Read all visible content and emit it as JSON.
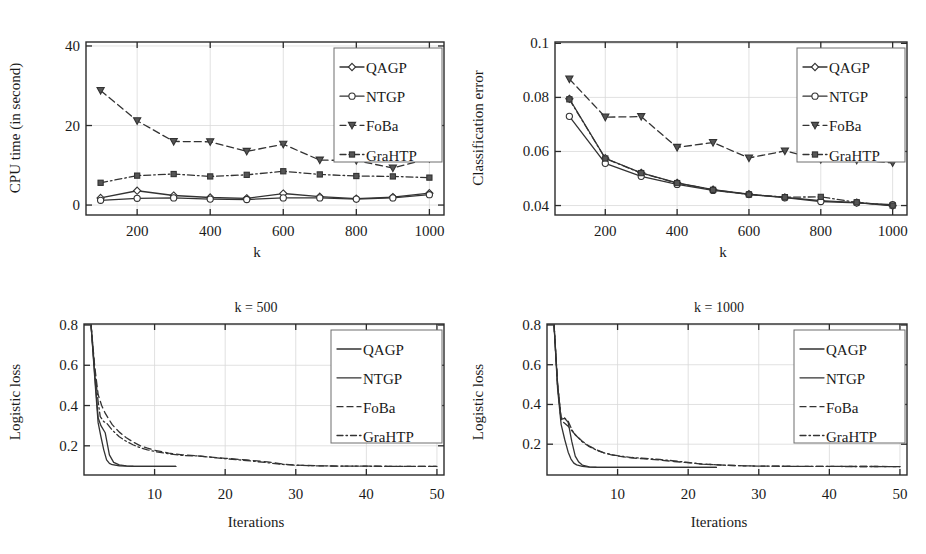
{
  "figure": {
    "panel_count": 4,
    "series_names": [
      "QAGP",
      "NTGP",
      "FoBa",
      "GraHTP"
    ]
  },
  "chart_data": [
    {
      "id": "cpu-time",
      "position": "top-left",
      "type": "line",
      "title": "",
      "xlabel": "k",
      "ylabel": "CPU time (in second)",
      "x": [
        100,
        200,
        300,
        400,
        500,
        600,
        700,
        800,
        900,
        1000
      ],
      "xlim": [
        60,
        1040
      ],
      "ylim": [
        -2.5,
        41
      ],
      "xticks": [
        200,
        400,
        600,
        800,
        1000
      ],
      "xtick_labels": [
        "200",
        "400",
        "600",
        "800",
        "1000"
      ],
      "yticks": [
        0,
        20,
        40
      ],
      "ytick_labels": [
        "0",
        "20",
        "40"
      ],
      "grid": true,
      "legend_position": "top-right",
      "legend_markers": true,
      "series": [
        {
          "name": "QAGP",
          "style": "solid",
          "marker": "diamond",
          "values": [
            1.8,
            3.6,
            2.4,
            1.9,
            1.7,
            2.9,
            2.1,
            1.6,
            2.0,
            3.0
          ]
        },
        {
          "name": "NTGP",
          "style": "solid",
          "marker": "circle",
          "values": [
            1.2,
            1.7,
            1.8,
            1.5,
            1.4,
            1.8,
            1.8,
            1.5,
            1.8,
            2.6
          ]
        },
        {
          "name": "FoBa",
          "style": "dashed",
          "marker": "triangle",
          "values": [
            28.8,
            21.2,
            16.0,
            15.9,
            13.5,
            15.3,
            11.3,
            11.2,
            9.3,
            11.7
          ]
        },
        {
          "name": "GraHTP",
          "style": "dashdot",
          "marker": "square",
          "values": [
            5.6,
            7.4,
            7.8,
            7.2,
            7.6,
            8.5,
            7.7,
            7.3,
            7.2,
            6.9
          ]
        }
      ]
    },
    {
      "id": "classification-error",
      "position": "top-right",
      "type": "line",
      "title": "",
      "xlabel": "k",
      "ylabel": "Classification error",
      "x": [
        100,
        200,
        300,
        400,
        500,
        600,
        700,
        800,
        900,
        1000
      ],
      "xlim": [
        60,
        1040
      ],
      "ylim": [
        0.0365,
        0.1005
      ],
      "xticks": [
        200,
        400,
        600,
        800,
        1000
      ],
      "xtick_labels": [
        "200",
        "400",
        "600",
        "800",
        "1000"
      ],
      "yticks": [
        0.04,
        0.06,
        0.08,
        0.1
      ],
      "ytick_labels": [
        "0.04",
        "0.06",
        "0.08",
        "0.1"
      ],
      "grid": true,
      "legend_position": "top-right",
      "legend_markers": true,
      "series": [
        {
          "name": "QAGP",
          "style": "solid",
          "marker": "diamond",
          "values": [
            0.0795,
            0.0575,
            0.0521,
            0.0484,
            0.0459,
            0.0442,
            0.043,
            0.0418,
            0.0411,
            0.0399
          ]
        },
        {
          "name": "NTGP",
          "style": "solid",
          "marker": "circle",
          "values": [
            0.073,
            0.0556,
            0.0508,
            0.0478,
            0.0456,
            0.0441,
            0.0429,
            0.0415,
            0.041,
            0.0403
          ]
        },
        {
          "name": "FoBa",
          "style": "dashed",
          "marker": "triangle",
          "values": [
            0.0868,
            0.0727,
            0.0729,
            0.0615,
            0.0633,
            0.0576,
            0.0602,
            0.057,
            0.0568,
            0.0558
          ]
        },
        {
          "name": "GraHTP",
          "style": "dashdot",
          "marker": "square",
          "values": [
            0.0793,
            0.0574,
            0.052,
            0.0483,
            0.0458,
            0.0441,
            0.0431,
            0.0432,
            0.0412,
            0.04
          ]
        }
      ]
    },
    {
      "id": "logistic-loss-k500",
      "position": "bottom-left",
      "type": "line",
      "title": "k = 500",
      "xlabel": "Iterations",
      "ylabel": "Logistic loss",
      "xlim": [
        0,
        51
      ],
      "ylim": [
        0.055,
        0.805
      ],
      "xticks": [
        10,
        20,
        30,
        40,
        50
      ],
      "xtick_labels": [
        "10",
        "20",
        "30",
        "40",
        "50"
      ],
      "yticks": [
        0.2,
        0.4,
        0.6,
        0.8
      ],
      "ytick_labels": [
        "0.2",
        "0.4",
        "0.6",
        "0.8"
      ],
      "grid": true,
      "legend_position": "top-right",
      "legend_markers": false,
      "series": [
        {
          "name": "QAGP",
          "style": "solid",
          "marker": "none",
          "x": [
            1,
            1.6,
            2,
            2.4,
            3,
            3.6,
            4.2,
            5,
            6,
            7,
            8,
            9,
            10,
            11,
            12,
            13
          ],
          "values": [
            0.8,
            0.52,
            0.34,
            0.3,
            0.265,
            0.155,
            0.118,
            0.105,
            0.1,
            0.0985,
            0.098,
            0.0978,
            0.0978,
            0.0978,
            0.0978,
            0.0978
          ]
        },
        {
          "name": "NTGP",
          "style": "solid",
          "marker": "none",
          "x": [
            1,
            1.6,
            2,
            2.4,
            2.8,
            3.2,
            3.6,
            4,
            5,
            6,
            7,
            8,
            9,
            10,
            11,
            12,
            13
          ],
          "values": [
            0.8,
            0.5,
            0.315,
            0.245,
            0.18,
            0.13,
            0.113,
            0.106,
            0.101,
            0.099,
            0.098,
            0.0978,
            0.0978,
            0.0978,
            0.0978,
            0.0978,
            0.0978
          ]
        },
        {
          "name": "FoBa",
          "style": "dashed",
          "marker": "none",
          "x": [
            1,
            1.5,
            2,
            2.5,
            3,
            4,
            5,
            6,
            7,
            8,
            9,
            10,
            12,
            14,
            16,
            18,
            20,
            23,
            26,
            28,
            30,
            34,
            38,
            42,
            46,
            50
          ],
          "values": [
            0.8,
            0.6,
            0.455,
            0.4,
            0.362,
            0.305,
            0.268,
            0.24,
            0.218,
            0.2,
            0.188,
            0.178,
            0.164,
            0.155,
            0.15,
            0.144,
            0.138,
            0.13,
            0.12,
            0.11,
            0.104,
            0.1,
            0.099,
            0.0985,
            0.098,
            0.0978
          ]
        },
        {
          "name": "GraHTP",
          "style": "dashdot",
          "marker": "none",
          "x": [
            1,
            1.5,
            2,
            2.3,
            2.8,
            3.2,
            4,
            5,
            6,
            7,
            8,
            9,
            10,
            12,
            14,
            16,
            18,
            20,
            23,
            26,
            28,
            30,
            34,
            38,
            42,
            46,
            50
          ],
          "values": [
            0.8,
            0.58,
            0.42,
            0.345,
            0.32,
            0.313,
            0.278,
            0.245,
            0.222,
            0.204,
            0.19,
            0.18,
            0.172,
            0.16,
            0.152,
            0.15,
            0.143,
            0.136,
            0.127,
            0.116,
            0.108,
            0.103,
            0.1,
            0.099,
            0.0983,
            0.098,
            0.0978
          ]
        }
      ]
    },
    {
      "id": "logistic-loss-k1000",
      "position": "bottom-right",
      "type": "line",
      "title": "k = 1000",
      "xlabel": "Iterations",
      "ylabel": "Logistic loss",
      "xlim": [
        0,
        51
      ],
      "ylim": [
        0.045,
        0.805
      ],
      "xticks": [
        10,
        20,
        30,
        40,
        50
      ],
      "xtick_labels": [
        "10",
        "20",
        "30",
        "40",
        "50"
      ],
      "yticks": [
        0.2,
        0.4,
        0.6,
        0.8
      ],
      "ytick_labels": [
        "0.2",
        "0.4",
        "0.6",
        "0.8"
      ],
      "grid": true,
      "legend_position": "top-right",
      "legend_markers": false,
      "series": [
        {
          "name": "QAGP",
          "style": "solid",
          "marker": "none",
          "x": [
            1,
            1.5,
            2,
            2.5,
            3,
            3.5,
            4,
            4.5,
            5,
            6,
            7,
            8,
            10,
            12,
            14,
            16,
            18,
            20,
            22,
            24
          ],
          "values": [
            0.8,
            0.5,
            0.325,
            0.33,
            0.31,
            0.215,
            0.14,
            0.11,
            0.095,
            0.0855,
            0.084,
            0.0835,
            0.0832,
            0.083,
            0.083,
            0.083,
            0.083,
            0.083,
            0.083,
            0.083
          ]
        },
        {
          "name": "NTGP",
          "style": "solid",
          "marker": "none",
          "x": [
            1,
            1.5,
            2,
            2.5,
            3,
            3.4,
            3.8,
            4.2,
            5,
            6,
            7,
            8,
            10,
            12,
            14,
            16,
            18,
            20,
            22,
            24
          ],
          "values": [
            0.8,
            0.48,
            0.3,
            0.225,
            0.16,
            0.125,
            0.105,
            0.096,
            0.0885,
            0.085,
            0.0838,
            0.0833,
            0.083,
            0.083,
            0.083,
            0.083,
            0.083,
            0.083,
            0.083,
            0.083
          ]
        },
        {
          "name": "FoBa",
          "style": "dashed",
          "marker": "none",
          "x": [
            1,
            1.5,
            2,
            2.5,
            3,
            4,
            5,
            6,
            7,
            8,
            9,
            10,
            12,
            14,
            16,
            18,
            20,
            22,
            25,
            28,
            30,
            34,
            38,
            42,
            46,
            50
          ],
          "values": [
            0.8,
            0.5,
            0.32,
            0.305,
            0.29,
            0.248,
            0.215,
            0.19,
            0.172,
            0.158,
            0.148,
            0.141,
            0.131,
            0.126,
            0.12,
            0.113,
            0.107,
            0.1,
            0.095,
            0.0912,
            0.09,
            0.089,
            0.0885,
            0.088,
            0.0878,
            0.0875
          ]
        },
        {
          "name": "GraHTP",
          "style": "dashdot",
          "marker": "none",
          "x": [
            1,
            1.5,
            2,
            2.4,
            3,
            3.6,
            4,
            5,
            6,
            7,
            8,
            9,
            10,
            12,
            14,
            16,
            18,
            20,
            22,
            25,
            28,
            30,
            34,
            38,
            42,
            46,
            50
          ],
          "values": [
            0.8,
            0.5,
            0.33,
            0.335,
            0.315,
            0.268,
            0.248,
            0.212,
            0.188,
            0.17,
            0.157,
            0.148,
            0.142,
            0.133,
            0.128,
            0.123,
            0.116,
            0.108,
            0.1,
            0.0945,
            0.091,
            0.0898,
            0.0888,
            0.0883,
            0.0879,
            0.0877,
            0.0875
          ]
        }
      ]
    }
  ],
  "legends": {
    "entries": [
      "QAGP",
      "NTGP",
      "FoBa",
      "GraHTP"
    ]
  },
  "colors": {
    "axis": "#2b2b2b",
    "grid": "#d9d9d9",
    "series": "#333333",
    "legend_border": "#6e6e6e",
    "background": "#ffffff"
  }
}
